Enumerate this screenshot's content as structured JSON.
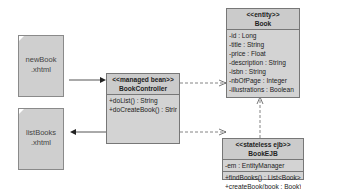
{
  "pages": [
    {
      "id": "newBook",
      "line1": "newBook",
      "line2": ".xhtml"
    },
    {
      "id": "listBooks",
      "line1": "listBooks",
      "line2": ".xhtml"
    }
  ],
  "classes": {
    "book": {
      "stereotype": "<<entity>>",
      "name": "Book",
      "attributes": [
        "-id : Long",
        "-title : String",
        "-price : Float",
        "-description : String",
        "-isbn : String",
        "-nbOfPage : Integer",
        "-illustrations : Boolean"
      ]
    },
    "controller": {
      "stereotype": "<<managed bean>>",
      "name": "BookController",
      "operations": [
        "+doList() : String",
        "+doCreateBook() : String"
      ]
    },
    "ejb": {
      "stereotype": "<<stateless ejb>>",
      "name": "BookEJB",
      "attributes": [
        "-em : EntityManager"
      ],
      "operations": [
        "+findBooks() : List<Book>",
        "+createBook(book : Book) : Book"
      ]
    }
  }
}
